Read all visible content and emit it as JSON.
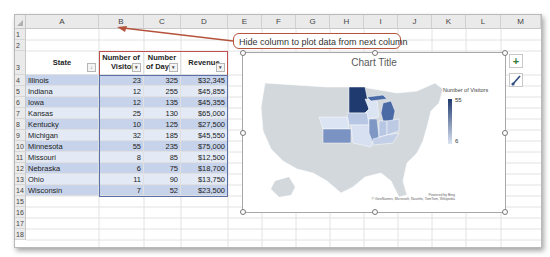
{
  "spreadsheet": {
    "columns": [
      "A",
      "B",
      "C",
      "D",
      "E",
      "F",
      "G",
      "H",
      "I",
      "J",
      "K",
      "L",
      "M"
    ],
    "rows": [
      "1",
      "2",
      "3",
      "4",
      "5",
      "6",
      "7",
      "8",
      "9",
      "10",
      "11",
      "12",
      "13",
      "14",
      "15",
      "16",
      "17",
      "18"
    ],
    "table": {
      "headers": {
        "state": "State",
        "visitors_line1": "Number of",
        "visitors_line2": "Visitors",
        "days_line1": "Number",
        "days_line2": "of Day",
        "revenue": "Revenue"
      },
      "rows": [
        {
          "state": "Illinois",
          "visitors": "23",
          "days": "325",
          "revenue": "$32,345"
        },
        {
          "state": "Indiana",
          "visitors": "12",
          "days": "255",
          "revenue": "$45,855"
        },
        {
          "state": "Iowa",
          "visitors": "12",
          "days": "135",
          "revenue": "$45,355"
        },
        {
          "state": "Kansas",
          "visitors": "25",
          "days": "130",
          "revenue": "$65,000"
        },
        {
          "state": "Kentucky",
          "visitors": "10",
          "days": "125",
          "revenue": "$27,500"
        },
        {
          "state": "Michigan",
          "visitors": "32",
          "days": "185",
          "revenue": "$45,550"
        },
        {
          "state": "Minnesota",
          "visitors": "55",
          "days": "235",
          "revenue": "$75,000"
        },
        {
          "state": "Missouri",
          "visitors": "8",
          "days": "85",
          "revenue": "$12,500"
        },
        {
          "state": "Nebraska",
          "visitors": "6",
          "days": "75",
          "revenue": "$18,700"
        },
        {
          "state": "Ohio",
          "visitors": "11",
          "days": "90",
          "revenue": "$13,750"
        },
        {
          "state": "Wisconsin",
          "visitors": "7",
          "days": "52",
          "revenue": "$23,500"
        }
      ]
    }
  },
  "callout": {
    "text": "Hide column to plot data from next column",
    "color": "#b5533c"
  },
  "chart": {
    "title": "Chart Title",
    "legend_title": "Number of Visitors",
    "legend_max": "55",
    "legend_min": "6",
    "credit_line1": "Powered by Bing",
    "credit_line2": "© GeoNames, Microsoft, Navinfo, TomTom, Wikipedia",
    "colors": {
      "max": "#1f3a6e",
      "min": "#dbe4f3",
      "base": "#d3d8dc"
    }
  },
  "side_buttons": {
    "add_element": "+",
    "style": "brush"
  }
}
